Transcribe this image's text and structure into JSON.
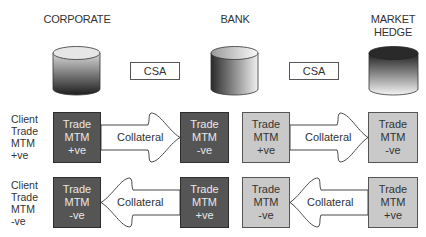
{
  "parties": [
    {
      "id": "corporate",
      "label": "CORPORATE",
      "lines": [
        "CORPORATE"
      ]
    },
    {
      "id": "bank",
      "label": "BANK",
      "lines": [
        "BANK"
      ]
    },
    {
      "id": "market_hedge",
      "label": "MARKET HEDGE",
      "lines": [
        "MARKET",
        "HEDGE"
      ]
    }
  ],
  "agreements": [
    {
      "label": "CSA",
      "between": [
        "corporate",
        "bank"
      ]
    },
    {
      "label": "CSA",
      "between": [
        "bank",
        "market_hedge"
      ]
    }
  ],
  "rows": [
    {
      "client_label": [
        "Client",
        "Trade",
        "MTM",
        "+ve"
      ],
      "boxes": [
        {
          "lines": [
            "Trade",
            "MTM",
            "+ve"
          ],
          "shade": "dark"
        },
        {
          "lines": [
            "Trade",
            "MTM",
            "-ve"
          ],
          "shade": "dark"
        },
        {
          "lines": [
            "Trade",
            "MTM",
            "+ve"
          ],
          "shade": "light"
        },
        {
          "lines": [
            "Trade",
            "MTM",
            "-ve"
          ],
          "shade": "light"
        }
      ],
      "arrows": [
        {
          "label": "Collateral",
          "direction": "right"
        },
        {
          "label": "Collateral",
          "direction": "right"
        }
      ]
    },
    {
      "client_label": [
        "Client",
        "Trade",
        "MTM",
        "-ve"
      ],
      "boxes": [
        {
          "lines": [
            "Trade",
            "MTM",
            "-ve"
          ],
          "shade": "dark"
        },
        {
          "lines": [
            "Trade",
            "MTM",
            "+ve"
          ],
          "shade": "dark"
        },
        {
          "lines": [
            "Trade",
            "MTM",
            "-ve"
          ],
          "shade": "light"
        },
        {
          "lines": [
            "Trade",
            "MTM",
            "+ve"
          ],
          "shade": "light"
        }
      ],
      "arrows": [
        {
          "label": "Collateral",
          "direction": "left"
        },
        {
          "label": "Collateral",
          "direction": "left"
        }
      ]
    }
  ],
  "colors": {
    "dark_box": "#555555",
    "light_box": "#c9c9c9",
    "outline": "#3a3a3a"
  }
}
